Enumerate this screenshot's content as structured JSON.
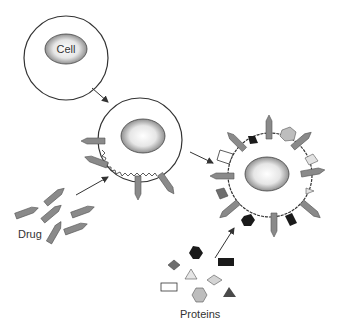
{
  "labels": {
    "cell": "Cell",
    "drug": "Drug",
    "proteins": "Proteins"
  },
  "colors": {
    "outline": "#333333",
    "drug_fill": "#8a8a8a",
    "dark": "#1a1a1a",
    "medium": "#6e6e6e",
    "light": "#cfcfcf",
    "lighter": "#e2e2e2",
    "white": "#ffffff"
  }
}
